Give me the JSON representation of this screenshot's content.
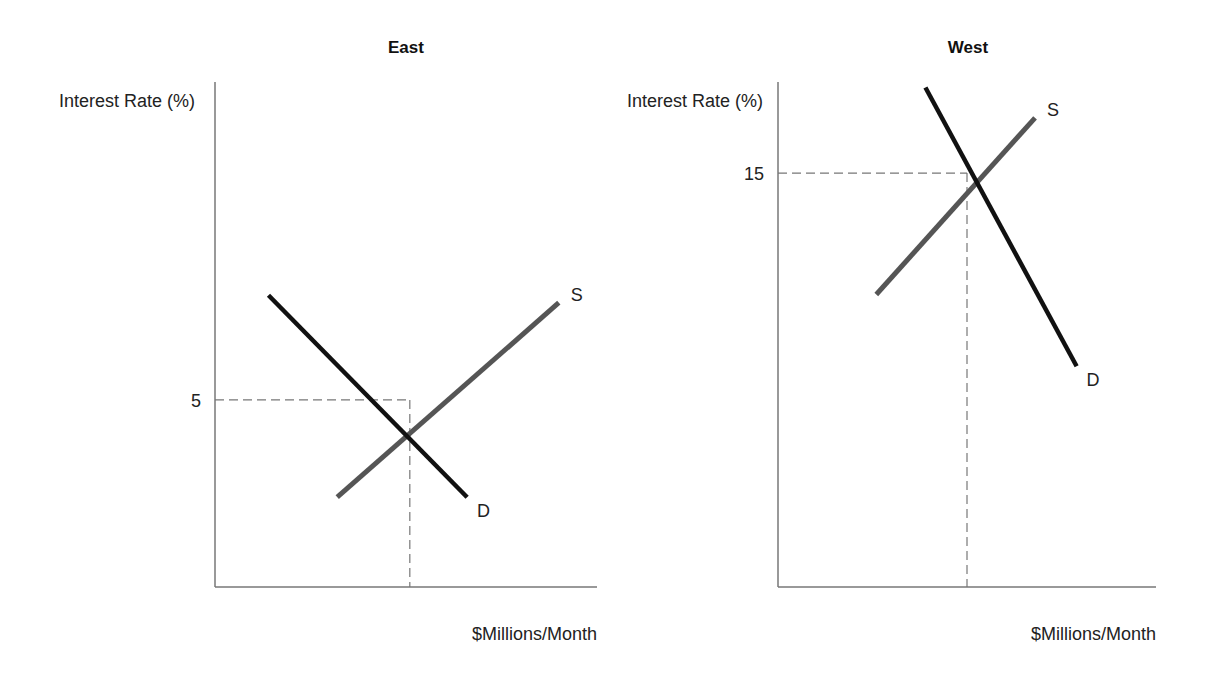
{
  "chart_data": [
    {
      "type": "line",
      "title": "East",
      "ylabel": "Interest Rate (%)",
      "xlabel": "$Millions/Month",
      "y_ticks": [
        {
          "value": 5,
          "label": "5"
        }
      ],
      "xlim": [
        0,
        10
      ],
      "ylim": [
        0,
        13.5
      ],
      "equilibrium": {
        "x": 5.1,
        "y": 5
      },
      "series": [
        {
          "name": "S",
          "label": "S",
          "role": "supply",
          "color": "#555555",
          "points": [
            {
              "x": 3.2,
              "y": 2.4
            },
            {
              "x": 9.0,
              "y": 7.6
            }
          ]
        },
        {
          "name": "D",
          "label": "D",
          "role": "demand",
          "color": "#111111",
          "points": [
            {
              "x": 1.4,
              "y": 7.8
            },
            {
              "x": 6.6,
              "y": 2.4
            }
          ]
        }
      ],
      "grid": false,
      "legend": "none"
    },
    {
      "type": "line",
      "title": "West",
      "ylabel": "Interest Rate (%)",
      "xlabel": "$Millions/Month",
      "y_ticks": [
        {
          "value": 15,
          "label": "15"
        }
      ],
      "xlim": [
        0,
        10
      ],
      "ylim": [
        0,
        18.3
      ],
      "equilibrium": {
        "x": 5.0,
        "y": 15
      },
      "series": [
        {
          "name": "S",
          "label": "S",
          "role": "supply",
          "color": "#555555",
          "points": [
            {
              "x": 2.6,
              "y": 10.6
            },
            {
              "x": 6.8,
              "y": 17.0
            }
          ]
        },
        {
          "name": "D",
          "label": "D",
          "role": "demand",
          "color": "#111111",
          "points": [
            {
              "x": 3.9,
              "y": 18.1
            },
            {
              "x": 7.9,
              "y": 8.0
            }
          ]
        }
      ],
      "grid": false,
      "legend": "none"
    }
  ]
}
